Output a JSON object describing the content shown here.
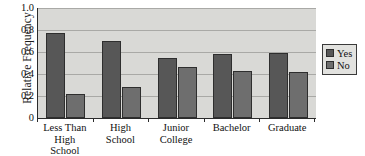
{
  "chart_data": {
    "type": "bar",
    "title": "",
    "subtitle": "",
    "xlabel": "",
    "ylabel": "Relative Frequency",
    "categories": [
      "Less Than\nHigh\nSchool",
      "High\nSchool",
      "Junior\nCollege",
      "Bachelor",
      "Graduate"
    ],
    "series": [
      {
        "name": "Yes",
        "color": "#575757",
        "values": [
          0.77,
          0.7,
          0.55,
          0.58,
          0.59
        ]
      },
      {
        "name": "No",
        "color": "#6e6e6e",
        "values": [
          0.22,
          0.28,
          0.46,
          0.43,
          0.42
        ]
      }
    ],
    "ylim": [
      0,
      1.0
    ],
    "yticks": [
      0,
      0.2,
      0.4,
      0.6,
      0.8,
      1.0
    ],
    "ytick_labels": [
      "0",
      "0.2",
      "0.4",
      "0.6",
      "0.8",
      "1.0"
    ],
    "grid": true,
    "grid_axis": "y",
    "legend_position": "right",
    "plot_background": "#d9d9d6",
    "grid_color": "#a9a9a6",
    "axis_color": "#2b2b2b"
  },
  "legend": {
    "entries": [
      {
        "label": "Yes"
      },
      {
        "label": "No"
      }
    ]
  }
}
